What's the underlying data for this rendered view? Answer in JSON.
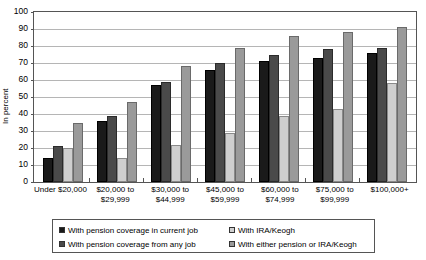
{
  "chart_data": {
    "type": "bar",
    "title": "",
    "xlabel": "",
    "ylabel": "In percent",
    "ylim": [
      0,
      100
    ],
    "ytick_step": 10,
    "ytick_labels": [
      "100",
      "90",
      "80",
      "70",
      "60",
      "50",
      "40",
      "30",
      "20",
      "10",
      "0"
    ],
    "grid": true,
    "legend_position": "bottom",
    "categories": [
      "Under $20,000",
      "$20,000 to\n$29,999",
      "$30,000 to\n$44,999",
      "$45,000 to\n$59,999",
      "$60,000 to\n$74,999",
      "$75,000 to\n$99,999",
      "$100,000+"
    ],
    "series": [
      {
        "name": "With pension coverage in current job",
        "color": "#1a1a1a",
        "values": [
          14,
          36,
          57,
          66,
          71,
          73,
          76
        ]
      },
      {
        "name": "With pension coverage from any job",
        "color": "#4a4a4a",
        "values": [
          21,
          39,
          59,
          70,
          75,
          78,
          79
        ]
      },
      {
        "name": "With IRA/Keogh",
        "color": "#cfcfcf",
        "values": [
          20,
          14,
          22,
          29,
          39,
          43,
          58
        ]
      },
      {
        "name": "With either pension or IRA/Keogh",
        "color": "#9a9a9a",
        "values": [
          35,
          47,
          68,
          79,
          86,
          88,
          91
        ]
      }
    ]
  },
  "legend": {
    "entries": [
      "With pension coverage in current job",
      "With IRA/Keogh",
      "With pension coverage from any job",
      "With either pension or IRA/Keogh"
    ]
  }
}
